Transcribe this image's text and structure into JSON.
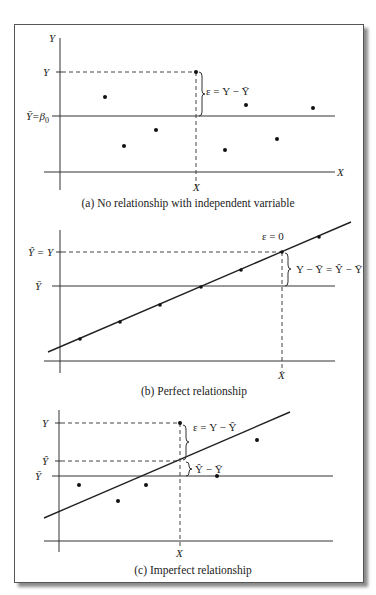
{
  "figure": {
    "panels": [
      {
        "id": "a",
        "caption": "(a) No relationship with independent varriable",
        "y_axis_label": "Y",
        "x_axis_label": "X",
        "y_tick_label": "Y",
        "ybar_label": "Ȳ=β",
        "ybar_sub": "0",
        "x_tick_label": "X",
        "annotation": "ε = Y − Ȳ",
        "points": [
          [
            105,
            97
          ],
          [
            124,
            146
          ],
          [
            156,
            130
          ],
          [
            196,
            72
          ],
          [
            246,
            105
          ],
          [
            225,
            150
          ],
          [
            277,
            139
          ],
          [
            313,
            108
          ]
        ]
      },
      {
        "id": "b",
        "caption": "(b) Perfect relationship",
        "yhat_tick_label": "Ŷ = Y",
        "ybar_label": "Ȳ",
        "x_tick_label": "X",
        "epsilon_label": "ε = 0",
        "annotation": "Y − Ȳ = Ŷ − Ȳ",
        "points": [
          [
            80,
            339
          ],
          [
            120,
            322
          ],
          [
            160,
            305
          ],
          [
            201,
            287
          ],
          [
            241,
            270
          ],
          [
            282,
            252
          ],
          [
            319,
            237
          ]
        ]
      },
      {
        "id": "c",
        "caption": "(c) Imperfect relationship",
        "y_tick_label": "Y",
        "yhat_tick_label": "Ŷ",
        "ybar_label": "Ȳ",
        "x_tick_label": "X",
        "annotation_error": "ε = Y − Ŷ",
        "annotation_explained": "Ŷ − Ȳ",
        "points": [
          [
            79,
            485
          ],
          [
            118,
            501
          ],
          [
            146,
            485
          ],
          [
            180,
            423
          ],
          [
            217,
            476
          ],
          [
            257,
            440
          ]
        ]
      }
    ]
  }
}
